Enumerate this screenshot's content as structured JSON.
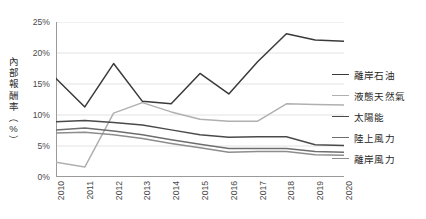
{
  "chart_data": {
    "type": "line",
    "title": "",
    "subtitle": "",
    "xlabel": "",
    "ylabel": "內部報酬率（%）",
    "ylabel_chars": [
      "內",
      "部",
      "報",
      "酬",
      "率",
      "（",
      "%",
      "）"
    ],
    "x": [
      "2010",
      "2011",
      "2012",
      "2013",
      "2014",
      "2015",
      "2016",
      "2017",
      "2018",
      "2019",
      "2020"
    ],
    "categories": [
      "2010",
      "2011",
      "2012",
      "2013",
      "2014",
      "2015",
      "2016",
      "2017",
      "2018",
      "2019",
      "2020"
    ],
    "ylim": [
      0,
      25
    ],
    "yticks": [
      0,
      5,
      10,
      15,
      20,
      25
    ],
    "ytick_labels": [
      "0%",
      "5%",
      "10%",
      "15%",
      "20%",
      "25%"
    ],
    "grid": true,
    "grid_axis": "y",
    "legend_position": "right",
    "series": [
      {
        "name": "離岸石油",
        "color": "#3a3a3a",
        "values": [
          15.9,
          11.3,
          18.3,
          12.2,
          11.8,
          16.7,
          13.4,
          18.6,
          23.1,
          22.1,
          21.9
        ]
      },
      {
        "name": "液態天然氣",
        "color": "#b0b0b0",
        "values": [
          2.4,
          1.6,
          10.3,
          12.0,
          10.5,
          9.3,
          9.0,
          9.0,
          11.8,
          11.7,
          11.6
        ]
      },
      {
        "name": "太陽能",
        "color": "#4a4a4a",
        "values": [
          8.9,
          9.1,
          8.8,
          8.4,
          7.6,
          6.8,
          6.4,
          6.5,
          6.5,
          5.2,
          5.1
        ]
      },
      {
        "name": "陸上風力",
        "color": "#6e6e6e",
        "values": [
          7.6,
          7.9,
          7.4,
          6.8,
          6.0,
          5.3,
          4.6,
          4.6,
          4.6,
          4.1,
          4.0
        ]
      },
      {
        "name": "離岸風力",
        "color": "#8d8d8d",
        "values": [
          7.1,
          7.2,
          6.8,
          6.2,
          5.4,
          4.7,
          4.0,
          4.1,
          4.1,
          3.6,
          3.5
        ]
      }
    ]
  },
  "legend": {
    "items": [
      {
        "label": "離岸石油",
        "color": "#3a3a3a"
      },
      {
        "label": "液態天然氣",
        "color": "#b0b0b0"
      },
      {
        "label": "太陽能",
        "color": "#4a4a4a"
      },
      {
        "label": "陸上風力",
        "color": "#6e6e6e"
      },
      {
        "label": "離岸風力",
        "color": "#8d8d8d"
      }
    ]
  },
  "axis": {
    "axis_color": "#9a9a9a",
    "grid_color": "#e3e3e3",
    "tick_text_color": "#4a4a4a"
  }
}
